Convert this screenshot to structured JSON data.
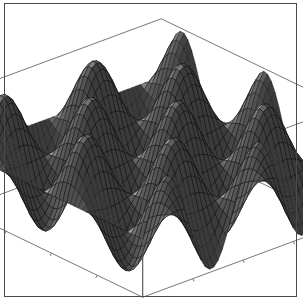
{
  "figure": {
    "title": "",
    "width": 303,
    "height": 302,
    "background_color": "#ffffff",
    "frame_color": "#4a4a4a",
    "frame_visible": true
  },
  "chart_data": {
    "type": "surface3d",
    "title": "",
    "subtitle": "",
    "xlabel": "",
    "ylabel": "",
    "zlabel": "",
    "function": "sin(x) * sin(y)",
    "xlim": [
      0,
      14
    ],
    "ylim": [
      0,
      14
    ],
    "zlim": [
      -1,
      1
    ],
    "x_tick_values": [
      0,
      5,
      10
    ],
    "y_tick_values": [
      0,
      5,
      10
    ],
    "z_tick_values": [
      -1,
      0,
      1
    ],
    "x_tick_labels": [
      "",
      "",
      ""
    ],
    "y_tick_labels": [
      "",
      "",
      ""
    ],
    "z_tick_labels": [
      "",
      "",
      ""
    ],
    "tick_labels_shown": false,
    "axis_labels_shown": false,
    "legend": null,
    "legend_position": "none",
    "grid": false,
    "mesh": true,
    "mesh_lines_u": 48,
    "mesh_lines_v": 48,
    "samples_u": 48,
    "samples_v": 48,
    "periods_x": 2.2,
    "periods_y": 2.2,
    "bounding_box": true,
    "bounding_box_color": "#555555",
    "bounding_box_line_width": 0.8,
    "surface_color_dark": "#3b3b3b",
    "surface_color_light": "#c8c8c8",
    "surface_color_mid": "#6e6e6e",
    "mesh_line_color": "#101010",
    "shading": "grayscale-diffuse",
    "light_direction": [
      -0.45,
      -0.35,
      0.82
    ],
    "view": {
      "azimuth_deg": -37,
      "elevation_deg": 26,
      "scale": 1.0,
      "box_ratio_z": 0.42
    },
    "projection": {
      "origin_x": 152,
      "origin_y": 158,
      "x_axis_screen": [
        1.47,
        0.71
      ],
      "y_axis_screen": [
        1.62,
        -0.6
      ],
      "z_axis_screen": [
        0.0,
        -1.0
      ],
      "x_extent": 62,
      "y_extent": 62,
      "z_extent": 58
    },
    "axes_tick_marks": true,
    "tick_mark_length": 3
  },
  "accessibility": {
    "alt_text": "Three dimensional surface plot of a sinusoidal egg-carton function inside a wireframe bounding box"
  }
}
